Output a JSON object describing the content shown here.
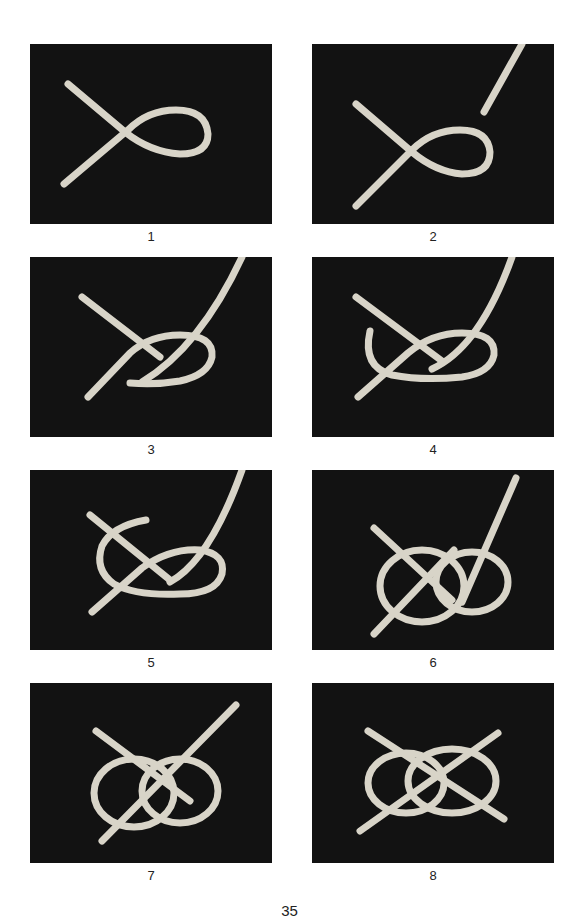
{
  "page": {
    "type": "instructional-figure",
    "page_number": "35",
    "page_number_clipped": true
  },
  "colors": {
    "panel_bg": "#121212",
    "rope": "#d8d4c8",
    "rope_shadow": "#8f8b80",
    "text": "#222222"
  },
  "steps": [
    {
      "label": "1",
      "description": "Rope laid with a single loop, ends crossing"
    },
    {
      "label": "2",
      "description": "Loop shown with second rope end entering from top right"
    },
    {
      "label": "3",
      "description": "Second end passes down through the loop"
    },
    {
      "label": "4",
      "description": "Second end curls around forming a hook"
    },
    {
      "label": "5",
      "description": "Second end wraps back over the crossing"
    },
    {
      "label": "6",
      "description": "Double loop forming, working end pointing up"
    },
    {
      "label": "7",
      "description": "Knot nearly complete, ends parallel"
    },
    {
      "label": "8",
      "description": "Completed knot with ends crossing in an X"
    }
  ]
}
